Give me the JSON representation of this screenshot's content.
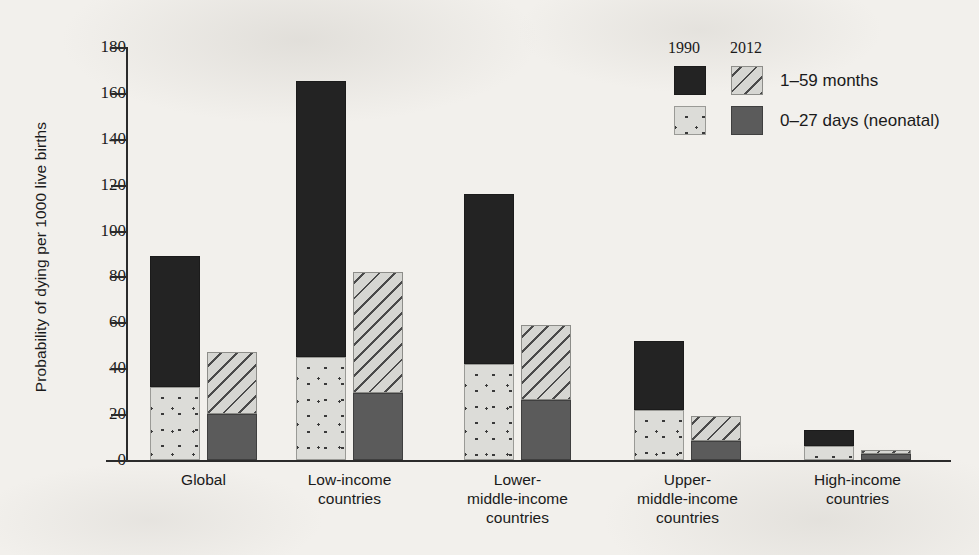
{
  "chart_data": {
    "type": "bar",
    "subtype": "grouped-stacked-bar",
    "title": "",
    "xlabel": "",
    "ylabel": "Probability of dying per 1000 live births",
    "ylim": [
      0,
      180
    ],
    "yticks": [
      0,
      20,
      40,
      60,
      80,
      100,
      120,
      140,
      160,
      180
    ],
    "ytick_labels": [
      "0",
      "20",
      "40",
      "60",
      "80",
      "100",
      "120",
      "140",
      "160",
      "180"
    ],
    "grid": false,
    "legend_position": "top-right",
    "categories": [
      "Global",
      "Low-income countries",
      "Lower-middle-income countries",
      "Upper-middle-income countries",
      "High-income countries"
    ],
    "category_label_lines": [
      [
        "Global"
      ],
      [
        "Low-income",
        "countries"
      ],
      [
        "Lower-",
        "middle-income",
        "countries"
      ],
      [
        "Upper-",
        "middle-income",
        "countries"
      ],
      [
        "High-income",
        "countries"
      ]
    ],
    "group_labels": [
      "1990",
      "2012"
    ],
    "stack_labels": [
      "0–27 days (neonatal)",
      "1–59 months"
    ],
    "series": [
      {
        "name": "1990 — 0–27 days (neonatal)",
        "year": "1990",
        "stack": "0–27 days (neonatal)",
        "values": [
          32,
          45,
          42,
          22,
          6
        ]
      },
      {
        "name": "1990 — 1–59 months",
        "year": "1990",
        "stack": "1–59 months",
        "values": [
          57,
          120,
          74,
          30,
          7
        ]
      },
      {
        "name": "2012 — 0–27 days (neonatal)",
        "year": "2012",
        "stack": "0–27 days (neonatal)",
        "values": [
          20,
          29,
          26,
          8.5,
          2.5
        ]
      },
      {
        "name": "2012 — 1–59 months",
        "year": "2012",
        "stack": "1–59 months",
        "values": [
          27,
          53,
          33,
          10.5,
          2
        ]
      }
    ],
    "totals": {
      "1990": [
        89,
        165,
        116,
        52,
        13
      ],
      "2012": [
        47,
        82,
        59,
        19,
        4.5
      ]
    }
  },
  "legend": {
    "header_1990": "1990",
    "header_2012": "2012",
    "rows": [
      {
        "label": "1–59 months",
        "swatch_1990": "solid-black",
        "swatch_2012": "diagonal-hatch"
      },
      {
        "label": "0–27 days (neonatal)",
        "swatch_1990": "light-dotted",
        "swatch_2012": "solid-dark-gray"
      }
    ]
  },
  "colors": {
    "background": "#f2f0ec",
    "axis": "#2b2b2b",
    "text": "#1a1a1a",
    "seg_1990_upper": "#232323",
    "seg_1990_lower": "#dcdcd8",
    "seg_2012_upper": "#d6d6d2",
    "seg_2012_lower": "#5b5b5b"
  }
}
